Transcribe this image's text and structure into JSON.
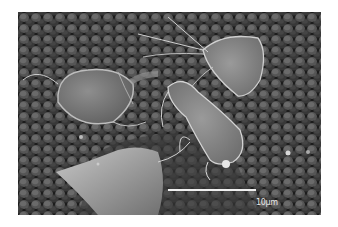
{
  "image": {
    "description": "Grayscale scanning electron micrograph: three pear-shaped flagellated protozoan trophozoites resting on a cobblestone-textured cell surface",
    "colors": {
      "background": "#ffffff",
      "surface": "#3a3a3a",
      "cells": "#8a8a8a",
      "scale_bar": "#f0f0f0"
    }
  },
  "scale_bar": {
    "label": "10µm"
  }
}
